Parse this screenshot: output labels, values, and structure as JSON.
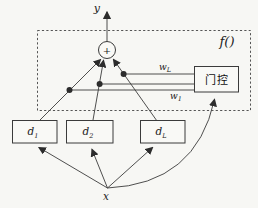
{
  "figure": {
    "output_label": "y",
    "input_label": "x",
    "function_label": "f()",
    "sum_symbol": "+",
    "gate_label": "门控",
    "weight_top": {
      "base": "w",
      "sub": "L"
    },
    "weight_bottom": {
      "base": "w",
      "sub": "1"
    },
    "delay_units": [
      {
        "base": "d",
        "sub": "1"
      },
      {
        "base": "d",
        "sub": "2"
      },
      {
        "base": "d",
        "sub": "L"
      }
    ],
    "colors": {
      "line": "#3b3b3b",
      "text": "#222222",
      "background": "#f7f7f4",
      "box_fill": "#f9f9f6",
      "dash_border": "#555555"
    }
  }
}
